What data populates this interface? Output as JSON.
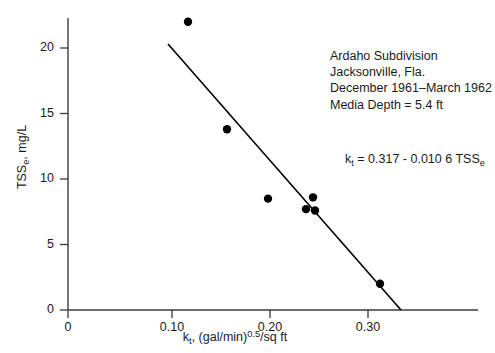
{
  "chart_data": {
    "type": "scatter",
    "title": "",
    "xlabel": "k_t, (gal/min)^0.5/sq ft",
    "ylabel": "TSS_e, mg/L",
    "xlim": [
      0,
      0.345
    ],
    "ylim": [
      0,
      23.2
    ],
    "grid": false,
    "legend": null,
    "x_ticks": [
      0,
      0.1,
      0.2,
      0.3
    ],
    "x_tick_labels": [
      "0",
      "0.10",
      "0.20",
      "0.30"
    ],
    "y_ticks": [
      0,
      5,
      10,
      15,
      20
    ],
    "y_tick_labels": [
      "0",
      "5",
      "10",
      "15",
      "20"
    ],
    "points": [
      {
        "x": 0.12,
        "y": 22.0
      },
      {
        "x": 0.159,
        "y": 13.8
      },
      {
        "x": 0.2,
        "y": 8.5
      },
      {
        "x": 0.238,
        "y": 7.7
      },
      {
        "x": 0.245,
        "y": 8.6
      },
      {
        "x": 0.247,
        "y": 7.6
      },
      {
        "x": 0.312,
        "y": 2.0
      }
    ],
    "marker": {
      "shape": "circle",
      "size": 6,
      "color": "#000000"
    },
    "trendline": {
      "x0": 0.1,
      "y0": 20.3,
      "x1": 0.333,
      "y1": 0.0,
      "color": "#000000",
      "width": 1.6
    },
    "axis_color": "#3a3a3a"
  },
  "axis_titles": {
    "y_prefix": "TSS",
    "y_sub": "e",
    "y_suffix": ", mg/L",
    "x_prefix": "k",
    "x_sub": "t",
    "x_mid": ", (gal/min)",
    "x_sup": "0.5",
    "x_suffix": "/sq ft"
  },
  "annotation": {
    "lines": [
      "Ardaho Subdivision",
      "Jacksonville, Fla.",
      "December 1961–March 1962",
      "Media Depth = 5.4 ft"
    ]
  },
  "equation": {
    "lhs_symbol": "k",
    "lhs_sub": "t",
    "body": " = 0.317 - 0.010 6 TSS",
    "trailing_sub": "e"
  }
}
